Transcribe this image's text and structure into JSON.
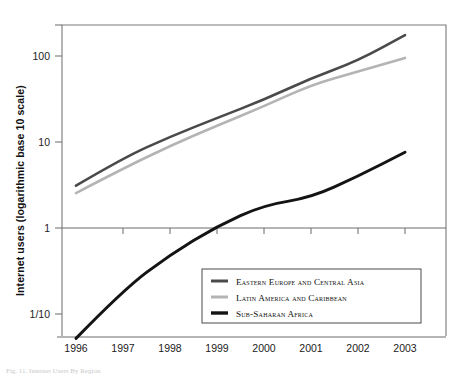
{
  "figure": {
    "caption": "Fig. 11. Internet Users By Region",
    "background_color": "#ffffff"
  },
  "chart_data": {
    "type": "line",
    "title": "",
    "xlabel": "",
    "ylabel": "Internet users (logarithmic base 10 scale)",
    "x": [
      1996,
      1997,
      1998,
      1999,
      2000,
      2001,
      2002,
      2003
    ],
    "xtick_labels": [
      "1996",
      "1997",
      "1998",
      "1999",
      "2000",
      "2001",
      "2002",
      "2003"
    ],
    "ytick_labels": [
      "100",
      "10",
      "1",
      "1/10"
    ],
    "ytick_values": [
      100,
      10,
      1,
      0.1
    ],
    "ylim": [
      0.04,
      420
    ],
    "xlim": [
      1995.7,
      2003.9
    ],
    "yscale": "log10",
    "grid": false,
    "legend_position": "bottom-center",
    "series": [
      {
        "name": "Eastern Europe and Central Asia",
        "color": "#4a4a4a",
        "width": 2.6,
        "values": [
          3.1,
          6.5,
          11.5,
          19.0,
          31.0,
          55.0,
          88.0,
          175.0
        ]
      },
      {
        "name": "Latin America and Caribbean",
        "color": "#b4b4b4",
        "width": 2.6,
        "values": [
          2.55,
          4.9,
          9.0,
          15.5,
          26.0,
          46.0,
          66.0,
          95.0
        ]
      },
      {
        "name": "Sub-Saharan Africa",
        "color": "#141414",
        "width": 3.0,
        "values": [
          0.052,
          0.19,
          0.49,
          1.05,
          1.85,
          2.25,
          4.0,
          7.6
        ]
      }
    ]
  },
  "axes": {
    "y_title": "Internet users (logarithmic base 10 scale)",
    "ticks_y": [
      {
        "label": "100",
        "value": 100
      },
      {
        "label": "10",
        "value": 10
      },
      {
        "label": "1",
        "value": 1
      },
      {
        "label": "1/10",
        "value": 0.1
      }
    ],
    "ticks_x": [
      {
        "label": "1996",
        "value": 1996
      },
      {
        "label": "1997",
        "value": 1997
      },
      {
        "label": "1998",
        "value": 1998
      },
      {
        "label": "1999",
        "value": 1999
      },
      {
        "label": "2000",
        "value": 2000
      },
      {
        "label": "2001",
        "value": 2001
      },
      {
        "label": "2002",
        "value": 2002
      },
      {
        "label": "2003",
        "value": 2003
      }
    ]
  },
  "legend": {
    "items": [
      {
        "label": "Eastern Europe and Central Asia",
        "color": "#4a4a4a"
      },
      {
        "label": "Latin America and Caribbean",
        "color": "#b4b4b4"
      },
      {
        "label": "Sub-Saharan Africa",
        "color": "#141414"
      }
    ]
  }
}
